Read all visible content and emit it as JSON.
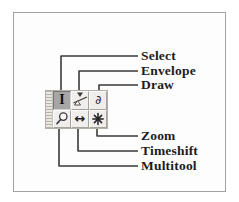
{
  "figure": {
    "description_labels": [
      {
        "label": "Select"
      },
      {
        "label": "Envelope"
      },
      {
        "label": "Draw"
      },
      {
        "label": "Zoom"
      },
      {
        "label": "Timeshift"
      },
      {
        "label": "Multitool"
      }
    ],
    "toolbar": {
      "grip": {
        "icon": "drag-handle-grip"
      },
      "buttons": [
        {
          "name": "selection-tool-button",
          "icon": "i-beam-cursor-icon",
          "glyph": "I",
          "selected": true
        },
        {
          "name": "envelope-tool-button",
          "icon": "envelope-handles-icon",
          "selected": false
        },
        {
          "name": "draw-tool-button",
          "icon": "pencil-icon",
          "glyph": "∂",
          "selected": false
        },
        {
          "name": "zoom-tool-button",
          "icon": "magnifier-icon",
          "selected": false
        },
        {
          "name": "timeshift-tool-button",
          "icon": "left-right-arrow-icon",
          "glyph": "↔",
          "selected": false
        },
        {
          "name": "multitool-button",
          "icon": "asterisk-star-icon",
          "selected": false
        }
      ]
    },
    "colors": {
      "frame_border": "#a2a2a2",
      "toolbar_background": "#d8d5ce",
      "button_face": "#efeeec",
      "selected_button_face": "#a6a6a6",
      "callout_line": "#3a3a3a",
      "label_text": "#1c1c1c"
    }
  }
}
